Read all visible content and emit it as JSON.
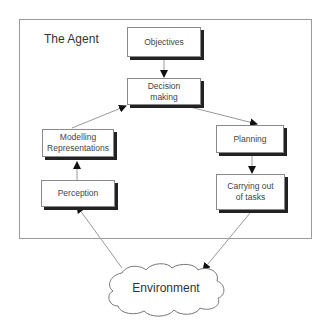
{
  "diagram": {
    "frame_title": "The Agent",
    "nodes": {
      "objectives": "Objectives",
      "decision_line1": "Decision",
      "decision_line2": "making",
      "modelling_line1": "Modelling",
      "modelling_line2": "Representations",
      "perception": "Perception",
      "planning": "Planning",
      "carrying_line1": "Carrying out",
      "carrying_line2": "of tasks",
      "environment": "Environment"
    },
    "edges": [
      {
        "from": "Objectives",
        "to": "Decision making"
      },
      {
        "from": "Decision making",
        "to": "Planning"
      },
      {
        "from": "Planning",
        "to": "Carrying out of tasks"
      },
      {
        "from": "Carrying out of tasks",
        "to": "Environment"
      },
      {
        "from": "Environment",
        "to": "Perception"
      },
      {
        "from": "Perception",
        "to": "Modelling Representations"
      },
      {
        "from": "Modelling Representations",
        "to": "Decision making"
      }
    ],
    "colors": {
      "border": "#8a8a8a",
      "shadow": "#222222",
      "line": "#999999",
      "arrowhead": "#111111"
    }
  }
}
